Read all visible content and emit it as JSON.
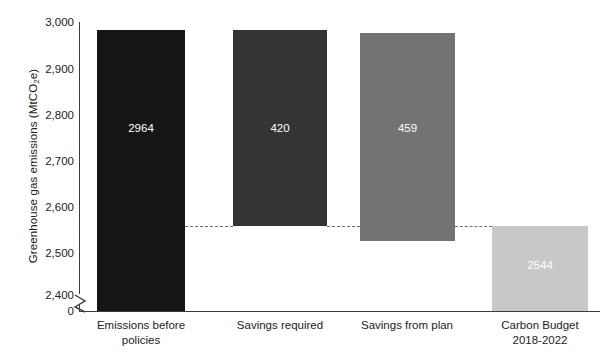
{
  "chart_data": {
    "type": "bar",
    "title": "",
    "subtitle": "",
    "xlabel": "",
    "ylabel": "Greenhouse gas emissions (MtCO2e)",
    "ylabel_parts": {
      "pre": "Greenhouse gas emissions (MtCO",
      "sub": "2",
      "post": "e)"
    },
    "categories": [
      "Emissions before policies",
      "Savings required",
      "Savings from plan",
      "Carbon Budget 2018-2022"
    ],
    "category_lines": [
      [
        "Emissions before",
        "policies"
      ],
      [
        "Savings required"
      ],
      [
        "Savings from plan"
      ],
      [
        "Carbon Budget",
        "2018-2022"
      ]
    ],
    "values": [
      2964,
      420,
      459,
      2544
    ],
    "value_labels": [
      "2964",
      "420",
      "459",
      "2544"
    ],
    "bar_spans": [
      {
        "from": 2400,
        "to": 2964
      },
      {
        "from": 2544,
        "to": 2964
      },
      {
        "from": 2513,
        "to": 2972
      },
      {
        "from": 2400,
        "to": 2544
      }
    ],
    "bar_colors": [
      "#151515",
      "#343434",
      "#737373",
      "#c8c8c8"
    ],
    "connector_level": 2544,
    "connector_style": "dashed",
    "connector_color": "#6f6f6f",
    "ylim": [
      2400,
      3000
    ],
    "axis_break": true,
    "axis_break_symbol": "zigzag",
    "grid": false,
    "legend": "none",
    "yticks": [
      2400,
      2500,
      2600,
      2700,
      2800,
      2900,
      3000
    ],
    "ytick_labels": [
      "2,400",
      "2,500",
      "2,600",
      "2,700",
      "2,800",
      "2,900",
      "3,000"
    ],
    "zero_tick_label": "0",
    "axis_color": "#3b3b3b",
    "text_color": "#222222",
    "value_label_color": "#ffffff",
    "background": "#ffffff"
  },
  "geometry": {
    "ytick_y": [
      295,
      252.5,
      206.5,
      160.5,
      114.5,
      68.5,
      22
    ],
    "zero_y": 311,
    "bars": [
      {
        "x": 97,
        "y": 30,
        "w": 88,
        "h": 281,
        "label_y": 122
      },
      {
        "x": 233,
        "y": 30,
        "w": 94,
        "h": 196,
        "label_y": 122
      },
      {
        "x": 360,
        "y": 33,
        "w": 95,
        "h": 208,
        "label_y": 122
      },
      {
        "x": 492,
        "y": 226,
        "w": 96,
        "h": 85,
        "label_y": 259
      }
    ],
    "connectors": [
      {
        "x": 185,
        "y": 226,
        "w": 48
      },
      {
        "x": 327,
        "y": 226,
        "w": 33
      },
      {
        "x": 455,
        "y": 226,
        "w": 37
      }
    ],
    "cat_label_x": [
      77,
      220,
      347,
      478
    ],
    "cat_label_w": [
      128,
      120,
      120,
      124
    ]
  }
}
